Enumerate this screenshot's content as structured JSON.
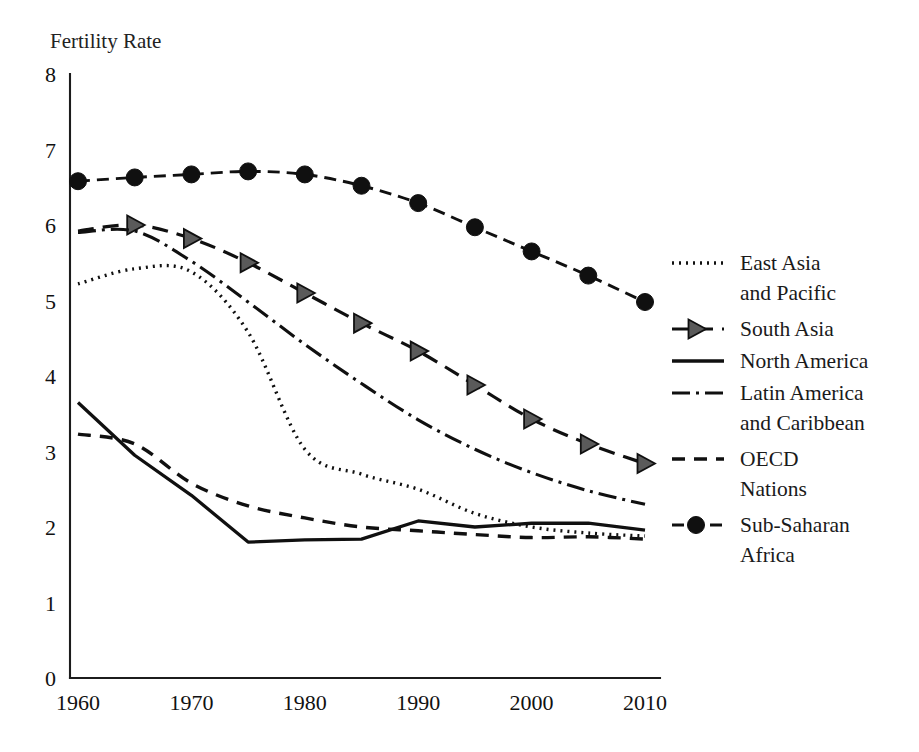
{
  "chart_data": {
    "type": "line",
    "title": "",
    "ylabel": "Fertility Rate",
    "xlabel": "",
    "xlim": [
      1960,
      2010
    ],
    "ylim": [
      0,
      8
    ],
    "yticks": [
      0,
      1,
      2,
      3,
      4,
      5,
      6,
      7,
      8
    ],
    "ytick_labels": [
      "0",
      "1",
      "2",
      "3",
      "4",
      "5",
      "6",
      "7",
      "8"
    ],
    "xticks": [
      1960,
      1970,
      1980,
      1990,
      2000,
      2010
    ],
    "xtick_labels": [
      "1960",
      "1970",
      "1980",
      "1990",
      "2000",
      "2010"
    ],
    "grid": false,
    "legend_position": "right",
    "x": [
      1960,
      1965,
      1970,
      1975,
      1980,
      1985,
      1990,
      1995,
      2000,
      2005,
      2010
    ],
    "series": [
      {
        "name": "East Asia and Pacific",
        "label_lines": [
          "East Asia",
          "and Pacific"
        ],
        "dash": "2,5",
        "width": 3.4,
        "marker": "none",
        "values": [
          5.22,
          5.42,
          5.38,
          4.58,
          3.03,
          2.7,
          2.5,
          2.18,
          2.0,
          1.92,
          1.88
        ]
      },
      {
        "name": "South Asia",
        "label_lines": [
          "South Asia"
        ],
        "dash": "16,9",
        "width": 3.2,
        "marker": "triangle",
        "values": [
          5.92,
          6.0,
          5.82,
          5.5,
          5.1,
          4.7,
          4.33,
          3.88,
          3.43,
          3.1,
          2.84
        ]
      },
      {
        "name": "North America",
        "label_lines": [
          "North America"
        ],
        "dash": "none",
        "width": 3.3,
        "marker": "none",
        "values": [
          3.65,
          2.95,
          2.42,
          1.8,
          1.83,
          1.84,
          2.08,
          2.0,
          2.05,
          2.05,
          1.96
        ]
      },
      {
        "name": "Latin America and Caribbean",
        "label_lines": [
          "Latin America",
          "and Caribbean"
        ],
        "dash": "18,6,3,6",
        "width": 3.1,
        "marker": "none",
        "values": [
          5.9,
          5.92,
          5.52,
          4.98,
          4.42,
          3.9,
          3.42,
          3.03,
          2.72,
          2.48,
          2.3
        ]
      },
      {
        "name": "OECD Nations",
        "label_lines": [
          "OECD",
          "Nations"
        ],
        "dash": "13,9",
        "width": 3.4,
        "marker": "none",
        "values": [
          3.23,
          3.1,
          2.58,
          2.28,
          2.12,
          2.0,
          1.95,
          1.9,
          1.86,
          1.87,
          1.84
        ]
      },
      {
        "name": "Sub-Saharan Africa",
        "label_lines": [
          "Sub-Saharan",
          "Africa"
        ],
        "dash": "12,7",
        "width": 2.9,
        "marker": "circle",
        "values": [
          6.58,
          6.63,
          6.67,
          6.71,
          6.67,
          6.52,
          6.29,
          5.97,
          5.65,
          5.33,
          4.98
        ]
      }
    ]
  },
  "caption": {
    "text": ""
  },
  "colors": {
    "ink": "#101010",
    "marker_fill_dark": "#101010",
    "marker_fill_gray": "#5a5a5a",
    "background": "#ffffff"
  }
}
